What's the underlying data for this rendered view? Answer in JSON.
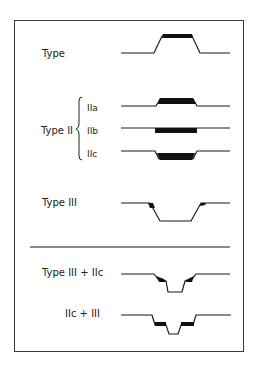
{
  "labels": {
    "type": "Type",
    "type2": "Type II",
    "iia": "IIa",
    "iib": "IIb",
    "iic": "IIc",
    "type3": "Type III",
    "type3_iic": "Type III + IIc",
    "iic_3": "IIc + III"
  },
  "colors": {
    "line": "#1a1a1a",
    "fill": "#111111",
    "border": "#3a3a3a"
  }
}
